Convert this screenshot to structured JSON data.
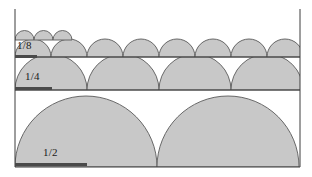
{
  "figure": {
    "name": "halving-semicircles-diagram",
    "type": "geometric-series-illustration",
    "width": 312,
    "height": 177,
    "background_color": "#ffffff",
    "fill_color": "#c8c8c8",
    "stroke_color": "#5a5a5a",
    "axis_color": "#3d3d3d",
    "bar_color": "#4a4a4a",
    "label_color": "#1a1a1a"
  },
  "axes": {
    "left_x": 15,
    "left_top_y": 9,
    "right_x": 300,
    "right_top_y": 9,
    "baseline_y": 167,
    "baseline_left_x": 15,
    "baseline_right_x": 300
  },
  "dividers": [
    {
      "name": "divider-quarter-top",
      "y": 57,
      "x1": 15,
      "x2": 300
    },
    {
      "name": "divider-half-top",
      "y": 90,
      "x1": 15,
      "x2": 300
    },
    {
      "name": "divider-baseline",
      "y": 167,
      "x1": 15,
      "x2": 300
    }
  ],
  "tiers": [
    {
      "id": "tier-sixteenth",
      "label": "",
      "fraction_value": 0.0625,
      "count": 3,
      "radius": 9.5,
      "diameter": 19,
      "baseline_y": 40,
      "start_x": 15,
      "clipped": true
    },
    {
      "id": "tier-eighth",
      "label": "1/8",
      "fraction_value": 0.125,
      "count": 8,
      "radius": 18,
      "diameter": 36,
      "baseline_y": 57,
      "start_x": 15,
      "clipped": false,
      "label_x": 17,
      "label_y": 45,
      "bar": {
        "x": 15,
        "y": 55,
        "width": 22
      }
    },
    {
      "id": "tier-quarter",
      "label": "1/4",
      "fraction_value": 0.25,
      "count": 4,
      "radius": 36,
      "diameter": 72,
      "baseline_y": 90,
      "start_x": 15,
      "clipped": false,
      "label_x": 25,
      "label_y": 76,
      "bar": {
        "x": 15,
        "y": 87,
        "width": 37
      }
    },
    {
      "id": "tier-half",
      "label": "1/2",
      "fraction_value": 0.5,
      "count": 2,
      "radius": 71,
      "diameter": 142,
      "baseline_y": 167,
      "start_x": 15,
      "clipped": false,
      "label_x": 43,
      "label_y": 152,
      "bar": {
        "x": 15,
        "y": 163,
        "width": 72
      }
    }
  ],
  "chart_data": {
    "type": "diagram",
    "title": "",
    "series": [
      {
        "name": "1/2",
        "diameter_fraction": 0.5,
        "count": 2
      },
      {
        "name": "1/4",
        "diameter_fraction": 0.25,
        "count": 4
      },
      {
        "name": "1/8",
        "diameter_fraction": 0.125,
        "count": 8
      },
      {
        "name": "1/16",
        "diameter_fraction": 0.0625,
        "count": 16
      }
    ],
    "categories": [
      "1/2",
      "1/4",
      "1/8",
      "1/16"
    ],
    "values": [
      2,
      4,
      8,
      16
    ],
    "xlabel": "",
    "ylabel": ""
  }
}
